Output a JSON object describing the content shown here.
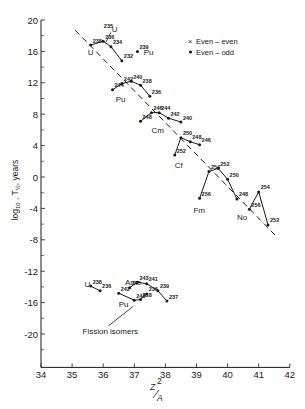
{
  "chart_data": {
    "type": "line",
    "title": "",
    "xlabel": "Z^2/A",
    "ylabel": "log10 T1/2, years",
    "xlim": [
      34,
      42
    ],
    "ylim": [
      -24,
      20
    ],
    "x_ticks": [
      34,
      35,
      36,
      37,
      38,
      39,
      40,
      41,
      42
    ],
    "y_ticks": [
      20,
      16,
      12,
      8,
      4,
      0,
      -4,
      -8,
      -12,
      -16,
      -20
    ],
    "grid": false,
    "legend": {
      "position": "upper-right",
      "entries": [
        {
          "marker": "x",
          "label": "Even – even"
        },
        {
          "marker": "dot",
          "label": "Even – odd"
        }
      ]
    },
    "trend_line": {
      "style": "dashed",
      "from": [
        35.1,
        18.7
      ],
      "to": [
        41.6,
        -7.7
      ]
    },
    "series": [
      {
        "name": "U",
        "label_pos": [
          35.5,
          15.5
        ],
        "points": [
          {
            "A": "238",
            "x": 35.6,
            "y": 16.8
          },
          {
            "A": "236",
            "x": 36.0,
            "y": 17.3
          },
          {
            "A": "234",
            "x": 36.25,
            "y": 16.6
          },
          {
            "A": "232",
            "x": 36.6,
            "y": 14.8
          }
        ],
        "extra": [
          {
            "A": "235",
            "x": 36.15,
            "y": 17.4,
            "type": "even-odd"
          }
        ]
      },
      {
        "name": "Pu",
        "label_pos": [
          37.3,
          15.6
        ],
        "points": [
          {
            "A": "239",
            "x": 37.1,
            "y": 16.0
          }
        ],
        "isolated": true
      },
      {
        "name": "Pu",
        "label_pos": [
          36.4,
          9.6
        ],
        "points": [
          {
            "A": "244",
            "x": 36.3,
            "y": 11.1
          },
          {
            "A": "242",
            "x": 36.6,
            "y": 11.9
          },
          {
            "A": "240",
            "x": 36.9,
            "y": 12.2
          },
          {
            "A": "238",
            "x": 37.2,
            "y": 11.7
          },
          {
            "A": "236",
            "x": 37.5,
            "y": 10.3
          }
        ]
      },
      {
        "name": "Cm",
        "label_pos": [
          37.55,
          5.6
        ],
        "points": [
          {
            "A": "248",
            "x": 37.2,
            "y": 7.1
          },
          {
            "A": "246",
            "x": 37.55,
            "y": 8.2
          },
          {
            "A": "244",
            "x": 37.8,
            "y": 8.2
          },
          {
            "A": "242",
            "x": 38.1,
            "y": 7.5
          },
          {
            "A": "240",
            "x": 38.5,
            "y": 7.0
          }
        ]
      },
      {
        "name": "Cf",
        "label_pos": [
          38.3,
          1.2
        ],
        "points": [
          {
            "A": "252",
            "x": 38.3,
            "y": 2.8
          },
          {
            "A": "250",
            "x": 38.5,
            "y": 5.0
          },
          {
            "A": "248",
            "x": 38.8,
            "y": 4.5
          },
          {
            "A": "246",
            "x": 39.1,
            "y": 4.1
          }
        ]
      },
      {
        "name": "Fm",
        "label_pos": [
          38.9,
          -4.6
        ],
        "points": [
          {
            "A": "256",
            "x": 39.1,
            "y": -2.7
          },
          {
            "A": "254",
            "x": 39.4,
            "y": 0.7
          },
          {
            "A": "252",
            "x": 39.7,
            "y": 1.1
          },
          {
            "A": "250",
            "x": 40.0,
            "y": -0.3
          },
          {
            "A": "248",
            "x": 40.3,
            "y": -2.8
          }
        ]
      },
      {
        "name": "No",
        "label_pos": [
          40.3,
          -5.5
        ],
        "points": [
          {
            "A": "256",
            "x": 40.7,
            "y": -4.1
          },
          {
            "A": "254",
            "x": 41.0,
            "y": -1.9
          },
          {
            "A": "252",
            "x": 41.3,
            "y": -6.1
          }
        ]
      },
      {
        "name": "U (fission isomers)",
        "label_pos": [
          35.4,
          -14.0
        ],
        "points": [
          {
            "A": "238",
            "x": 35.6,
            "y": -13.9
          },
          {
            "A": "236",
            "x": 35.9,
            "y": -14.5
          }
        ]
      },
      {
        "name": "Pu (fission isomers)",
        "label_pos": [
          36.5,
          -16.6
        ],
        "points": [
          {
            "A": "242",
            "x": 36.5,
            "y": -14.8
          },
          {
            "A": "240",
            "x": 37.0,
            "y": -15.7
          },
          {
            "A": "238",
            "x": 37.2,
            "y": -15.6
          },
          {
            "A": "236",
            "x": 37.4,
            "y": -14.9
          }
        ]
      },
      {
        "name": "Am (fission isomers)",
        "label_pos": [
          36.7,
          -13.8
        ],
        "points": [
          {
            "A": "245",
            "x": 36.85,
            "y": -14.1
          },
          {
            "A": "243",
            "x": 37.1,
            "y": -13.4
          },
          {
            "A": "241",
            "x": 37.4,
            "y": -13.6
          },
          {
            "A": "239",
            "x": 37.76,
            "y": -14.5
          },
          {
            "A": "237",
            "x": 38.05,
            "y": -15.8
          }
        ]
      }
    ],
    "annotations": [
      {
        "text": "Fission isomers",
        "at": [
          36.3,
          -18.7
        ],
        "arrow_to": [
          37.0,
          -15.7
        ]
      }
    ]
  },
  "labels": {
    "ylabel_main": "log",
    "ylabel_sub": "10",
    "ylabel_tau": "T",
    "ylabel_half": "½",
    "ylabel_units": ", years",
    "xlabel_num": "Z",
    "xlabel_sup": "2",
    "xlabel_den": "A",
    "fission_isomers": "Fission isomers",
    "legend_ee": "Even – even",
    "legend_eo": "Even – odd"
  }
}
